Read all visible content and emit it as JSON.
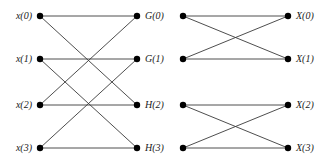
{
  "figure": {
    "width": 327,
    "height": 163,
    "background_color": "#ffffff",
    "edge_color": "#3a3a3a",
    "node_color": "#000000",
    "node_radius": 3.2,
    "edge_width": 0.9
  },
  "columns": [
    {
      "id": "input",
      "x": 40,
      "label_side": "left",
      "nodes": [
        {
          "id": "x0",
          "label": "x(0)",
          "y": 16
        },
        {
          "id": "x1",
          "label": "x(1)",
          "y": 59
        },
        {
          "id": "x2",
          "label": "x(2)",
          "y": 105
        },
        {
          "id": "x3",
          "label": "x(3)",
          "y": 148
        }
      ]
    },
    {
      "id": "stage1",
      "x": 137,
      "label_side": "right",
      "nodes": [
        {
          "id": "g0",
          "label": "G(0)",
          "y": 16
        },
        {
          "id": "g1",
          "label": "G(1)",
          "y": 59
        },
        {
          "id": "h2",
          "label": "H(2)",
          "y": 105
        },
        {
          "id": "h3",
          "label": "H(3)",
          "y": 148
        }
      ]
    },
    {
      "id": "stage2",
      "x": 183,
      "label_side": "none",
      "nodes": [
        {
          "id": "m0",
          "label": "",
          "y": 16
        },
        {
          "id": "m1",
          "label": "",
          "y": 59
        },
        {
          "id": "m2",
          "label": "",
          "y": 105
        },
        {
          "id": "m3",
          "label": "",
          "y": 148
        }
      ]
    },
    {
      "id": "output",
      "x": 288,
      "label_side": "right",
      "nodes": [
        {
          "id": "X0",
          "label": "X(0)",
          "y": 16
        },
        {
          "id": "X1",
          "label": "X(1)",
          "y": 59
        },
        {
          "id": "X2",
          "label": "X(2)",
          "y": 105
        },
        {
          "id": "X3",
          "label": "X(3)",
          "y": 148
        }
      ]
    }
  ],
  "edges": [
    {
      "from": "x0",
      "to": "g0"
    },
    {
      "from": "x0",
      "to": "h2"
    },
    {
      "from": "x1",
      "to": "g1"
    },
    {
      "from": "x1",
      "to": "h3"
    },
    {
      "from": "x2",
      "to": "g0"
    },
    {
      "from": "x2",
      "to": "h2"
    },
    {
      "from": "x3",
      "to": "g1"
    },
    {
      "from": "x3",
      "to": "h3"
    },
    {
      "from": "m0",
      "to": "X0"
    },
    {
      "from": "m0",
      "to": "X1"
    },
    {
      "from": "m1",
      "to": "X0"
    },
    {
      "from": "m1",
      "to": "X1"
    },
    {
      "from": "m2",
      "to": "X2"
    },
    {
      "from": "m2",
      "to": "X3"
    },
    {
      "from": "m3",
      "to": "X2"
    },
    {
      "from": "m3",
      "to": "X3"
    }
  ],
  "labels": {
    "input": [
      "x(0)",
      "x(1)",
      "x(2)",
      "x(3)"
    ],
    "stage1": [
      "G(0)",
      "G(1)",
      "H(2)",
      "H(3)"
    ],
    "output": [
      "X(0)",
      "X(1)",
      "X(2)",
      "X(3)"
    ]
  }
}
